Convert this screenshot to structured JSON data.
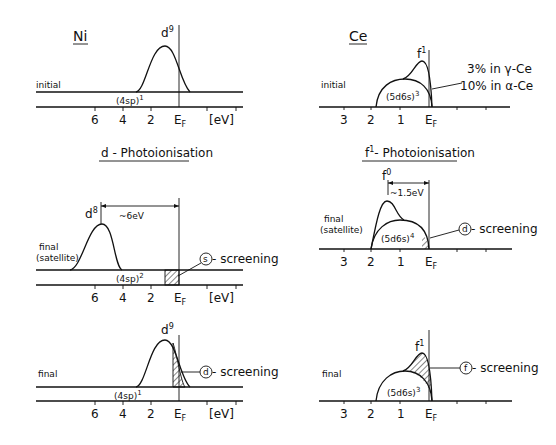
{
  "ni": {
    "title": "Ni",
    "initial": {
      "state_label": "initial",
      "peak_label": "d",
      "peak_sup": "9",
      "band_label": "(4sp)",
      "band_sup": "1",
      "ticks": [
        "6",
        "4",
        "2"
      ],
      "fermi_main": "E",
      "fermi_sub": "F",
      "unit": "[eV]"
    },
    "section_title": "d - Photoionisation",
    "satellite": {
      "state_label_1": "final",
      "state_label_2": "(satellite)",
      "peak_label": "d",
      "peak_sup": "8",
      "separation": "~6eV",
      "band_label": "(4sp)",
      "band_sup": "2",
      "screening_letter": "s",
      "screening_label": "- screening",
      "ticks": [
        "6",
        "4",
        "2"
      ],
      "fermi_main": "E",
      "fermi_sub": "F",
      "unit": "[eV]"
    },
    "final": {
      "state_label": "final",
      "peak_label": "d",
      "peak_sup": "9",
      "band_label": "(4sp)",
      "band_sup": "1",
      "screening_letter": "d",
      "screening_label": "- screening",
      "ticks": [
        "6",
        "4",
        "2"
      ],
      "fermi_main": "E",
      "fermi_sub": "F",
      "unit": "[eV]"
    }
  },
  "ce": {
    "title": "Ce",
    "initial": {
      "state_label": "initial",
      "peak_label": "f",
      "peak_sup": "1",
      "band_label": "(5d6s)",
      "band_sup": "3",
      "note_1": "3% in γ-Ce",
      "note_2": "10% in α-Ce",
      "ticks": [
        "3",
        "2",
        "1"
      ],
      "fermi_main": "E",
      "fermi_sub": "F"
    },
    "section_title_main": "f",
    "section_title_sup": "1",
    "section_title_rest": "- Photoionisation",
    "satellite": {
      "state_label_1": "final",
      "state_label_2": "(satellite)",
      "peak_label": "f",
      "peak_sup": "0",
      "separation": "~1.5eV",
      "band_label": "(5d6s)",
      "band_sup": "4",
      "screening_letter": "d",
      "screening_label": "- screening",
      "ticks": [
        "3",
        "2",
        "1"
      ],
      "fermi_main": "E",
      "fermi_sub": "F"
    },
    "final": {
      "state_label": "final",
      "peak_label": "f",
      "peak_sup": "1",
      "band_label": "(5d6s)",
      "band_sup": "3",
      "screening_letter": "f",
      "screening_label": "- screening",
      "ticks": [
        "3",
        "2",
        "1"
      ],
      "fermi_main": "E",
      "fermi_sub": "F"
    }
  }
}
